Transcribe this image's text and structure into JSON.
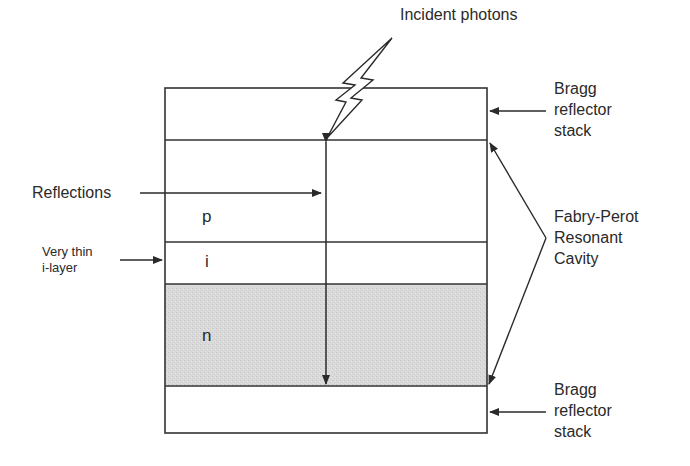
{
  "diagram": {
    "incident_label": "Incident photons",
    "reflections_label": "Reflections",
    "thin_layer_label": [
      "Very thin",
      "i-layer"
    ],
    "bragg_top_label": [
      "Bragg",
      "reflector",
      "stack"
    ],
    "bragg_bottom_label": [
      "Bragg",
      "reflector",
      "stack"
    ],
    "cavity_label": [
      "Fabry-Perot",
      "Resonant",
      "Cavity"
    ],
    "layers": [
      {
        "name": "top-bragg",
        "label": ""
      },
      {
        "name": "p-layer",
        "label": "p"
      },
      {
        "name": "i-layer",
        "label": "i"
      },
      {
        "name": "n-layer",
        "label": "n"
      },
      {
        "name": "bottom-bragg",
        "label": ""
      }
    ],
    "colors": {
      "stroke": "#333333",
      "n_fill": "#d9d9d9",
      "background": "#ffffff"
    }
  }
}
